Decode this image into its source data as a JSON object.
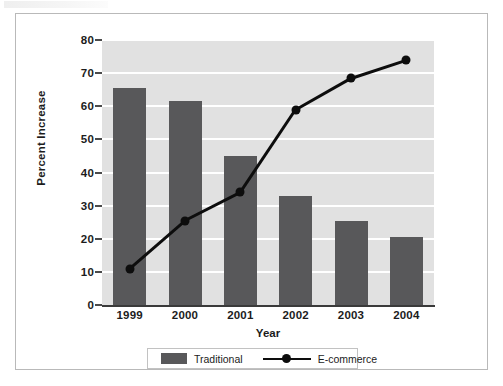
{
  "figure": {
    "scan_artifact_label": "scan-artifact"
  },
  "chart_data": {
    "type": "bar",
    "title": "",
    "subtitle": "",
    "xlabel": "Year",
    "ylabel": "Percent Increase",
    "categories": [
      "1999",
      "2000",
      "2001",
      "2002",
      "2003",
      "2004"
    ],
    "ylim": [
      0,
      80
    ],
    "yticks": [
      0,
      10,
      20,
      30,
      40,
      50,
      60,
      70,
      80
    ],
    "ytick_labels": [
      "0",
      "10",
      "20",
      "30",
      "40",
      "50",
      "60",
      "70",
      "80"
    ],
    "grid": true,
    "grid_color": "#ffffff",
    "plot_background": "#e1e1e1",
    "legend_position": "bottom",
    "series": [
      {
        "name": "Traditional",
        "type": "bar",
        "color": "#58585a",
        "values": [
          65.5,
          61.5,
          45,
          33,
          25.5,
          20.5
        ]
      },
      {
        "name": "E-commerce",
        "type": "line",
        "color": "#0d0d0d",
        "marker": "circle",
        "values": [
          11,
          25.5,
          34,
          59,
          68.5,
          74
        ]
      }
    ]
  },
  "legend": {
    "items": [
      {
        "label": "Traditional",
        "marker": "filled-square",
        "color": "#58585a"
      },
      {
        "label": "E-commerce",
        "marker": "line-with-circle",
        "color": "#0d0d0d"
      }
    ]
  }
}
